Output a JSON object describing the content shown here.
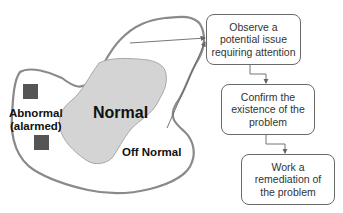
{
  "diagram": {
    "regions": {
      "normal": {
        "label": "Normal",
        "fill": "#d4d4d4"
      },
      "off_normal": {
        "label": "Off Normal"
      },
      "abnormal": {
        "label_line1": "Abnormal",
        "label_line2": "(alarmed)"
      }
    },
    "steps": [
      {
        "id": "observe",
        "text": "Observe a potential issue requiring attention"
      },
      {
        "id": "confirm",
        "text": "Confirm the existence of the problem"
      },
      {
        "id": "remediate",
        "text": "Work a remediation of the problem"
      }
    ],
    "icons": [
      {
        "name": "alarm-icon",
        "position": "above-abnormal-label"
      },
      {
        "name": "alarm-icon",
        "position": "below-abnormal-label"
      }
    ],
    "colors": {
      "outline": "#8a8a8a",
      "box_border": "#6a6a6a",
      "arrow": "#666666"
    }
  }
}
